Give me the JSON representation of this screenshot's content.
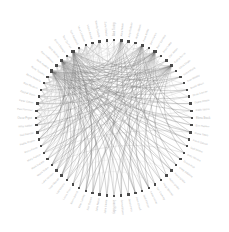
{
  "figure": {
    "background_color": "#ffffff",
    "width": 229,
    "height": 232
  },
  "chart_data": {
    "type": "network-chord",
    "title": "",
    "subtitle": "",
    "xlabel": "",
    "ylabel": "",
    "legend": [],
    "annotations": [],
    "layout": {
      "arrangement": "circular",
      "center_x": 114,
      "center_y": 118,
      "node_radius": 78,
      "label_radius": 82,
      "grid": false,
      "axes_visible": false,
      "label_orientation": "radial-outward",
      "start_angle_deg": -90,
      "direction": "clockwise"
    },
    "style": {
      "node_color": "#4a4a4a",
      "node_shape": "square",
      "node_size_px": 2.4,
      "hub_node_size_px": 3.2,
      "edge_color": "#9a9a9a",
      "edge_color_light": "#c8c8c8",
      "edge_color_dark": "#6e6e6e",
      "edge_width": 0.35,
      "label_color": "#b9b9b9",
      "label_font_size_px": 2.6
    },
    "node_count": 68,
    "nodes": [
      {
        "id": 0,
        "label": "Alan Turing"
      },
      {
        "id": 1,
        "label": "Alice Nolan"
      },
      {
        "id": 2,
        "label": "Amy Robson"
      },
      {
        "id": 3,
        "label": "Andre Marek"
      },
      {
        "id": 4,
        "label": "Anne Keller"
      },
      {
        "id": 5,
        "label": "Ben Harkin"
      },
      {
        "id": 6,
        "label": "Beth Conway"
      },
      {
        "id": 7,
        "label": "Brian Lowe"
      },
      {
        "id": 8,
        "label": "Carl Aston"
      },
      {
        "id": 9,
        "label": "Cathy Burns"
      },
      {
        "id": 10,
        "label": "Chris Doyle"
      },
      {
        "id": 11,
        "label": "Clara Mertz"
      },
      {
        "id": 12,
        "label": "Dan Whitby"
      },
      {
        "id": 13,
        "label": "David Olsen"
      },
      {
        "id": 14,
        "label": "Dean Farrow"
      },
      {
        "id": 15,
        "label": "Diana Reyes"
      },
      {
        "id": 16,
        "label": "Edith Vance"
      },
      {
        "id": 17,
        "label": "Elena Brask"
      },
      {
        "id": 18,
        "label": "Eric Halden"
      },
      {
        "id": 19,
        "label": "Fiona Yates"
      },
      {
        "id": 20,
        "label": "Frank Oduya"
      },
      {
        "id": 21,
        "label": "Gail Winter"
      },
      {
        "id": 22,
        "label": "Gary Nevins"
      },
      {
        "id": 23,
        "label": "Grace Holt"
      },
      {
        "id": 24,
        "label": "Greg Saldana"
      },
      {
        "id": 25,
        "label": "Hana Ishida"
      },
      {
        "id": 26,
        "label": "Helen Drake"
      },
      {
        "id": 27,
        "label": "Hugo Bennet"
      },
      {
        "id": 28,
        "label": "Ian Crawley"
      },
      {
        "id": 29,
        "label": "Irene Kovac"
      },
      {
        "id": 30,
        "label": "Jack Mercer"
      },
      {
        "id": 31,
        "label": "Jane Orwell"
      },
      {
        "id": 32,
        "label": "Jason Petri"
      },
      {
        "id": 33,
        "label": "Jenna Bloom"
      },
      {
        "id": 34,
        "label": "Joan Ridley"
      },
      {
        "id": 35,
        "label": "John Castle"
      },
      {
        "id": 36,
        "label": "Julia Nakai"
      },
      {
        "id": 37,
        "label": "Karl Ostrom"
      },
      {
        "id": 38,
        "label": "Kate Lumley"
      },
      {
        "id": 39,
        "label": "Kevin Brand"
      },
      {
        "id": 40,
        "label": "Laura Finch"
      },
      {
        "id": 41,
        "label": "Leo Vantini"
      },
      {
        "id": 42,
        "label": "Lisa Mowatt"
      },
      {
        "id": 43,
        "label": "Luke Hanson"
      },
      {
        "id": 44,
        "label": "Maria Solen"
      },
      {
        "id": 45,
        "label": "Mark Delane"
      },
      {
        "id": 46,
        "label": "Mary Ashton"
      },
      {
        "id": 47,
        "label": "Mona Ferris"
      },
      {
        "id": 48,
        "label": "Nadia Rostov"
      },
      {
        "id": 49,
        "label": "Neil Barrow"
      },
      {
        "id": 50,
        "label": "Nina Calder"
      },
      {
        "id": 51,
        "label": "Oscar Pryce"
      },
      {
        "id": 52,
        "label": "Paul Stenner"
      },
      {
        "id": 53,
        "label": "Peter Galvin"
      },
      {
        "id": 54,
        "label": "Rachel Dunn"
      },
      {
        "id": 55,
        "label": "Ray Bledsoe"
      },
      {
        "id": 56,
        "label": "Rhea Nakada"
      },
      {
        "id": 57,
        "label": "Rose Tanaka"
      },
      {
        "id": 58,
        "label": "Ruth Aveline"
      },
      {
        "id": 59,
        "label": "Sam Holloway"
      },
      {
        "id": 60,
        "label": "Sara Medina"
      },
      {
        "id": 61,
        "label": "Simon Ralegh"
      },
      {
        "id": 62,
        "label": "Tara Quinlan"
      },
      {
        "id": 63,
        "label": "Tom Beckford"
      },
      {
        "id": 64,
        "label": "Vera Lindqvist"
      },
      {
        "id": 65,
        "label": "Victor Amadi"
      },
      {
        "id": 66,
        "label": "Wendy Carlyle"
      },
      {
        "id": 67,
        "label": "Zane Okafor"
      }
    ],
    "hubs": [
      {
        "id": 58,
        "degree": 34
      },
      {
        "id": 60,
        "degree": 30
      },
      {
        "id": 62,
        "degree": 26
      },
      {
        "id": 6,
        "degree": 24
      },
      {
        "id": 9,
        "degree": 22
      },
      {
        "id": 4,
        "degree": 16
      },
      {
        "id": 1,
        "degree": 12
      }
    ],
    "edges": [
      [
        58,
        6
      ],
      [
        58,
        9
      ],
      [
        58,
        4
      ],
      [
        58,
        1
      ],
      [
        58,
        60
      ],
      [
        58,
        62
      ],
      [
        58,
        3
      ],
      [
        58,
        11
      ],
      [
        58,
        14
      ],
      [
        58,
        17
      ],
      [
        58,
        20
      ],
      [
        58,
        23
      ],
      [
        58,
        26
      ],
      [
        58,
        29
      ],
      [
        58,
        32
      ],
      [
        58,
        35
      ],
      [
        58,
        38
      ],
      [
        58,
        41
      ],
      [
        58,
        44
      ],
      [
        58,
        47
      ],
      [
        58,
        50
      ],
      [
        58,
        53
      ],
      [
        58,
        56
      ],
      [
        58,
        64
      ],
      [
        58,
        66
      ],
      [
        58,
        2
      ],
      [
        58,
        8
      ],
      [
        58,
        13
      ],
      [
        58,
        19
      ],
      [
        58,
        25
      ],
      [
        58,
        31
      ],
      [
        58,
        37
      ],
      [
        58,
        43
      ],
      [
        58,
        49
      ],
      [
        60,
        6
      ],
      [
        60,
        9
      ],
      [
        60,
        4
      ],
      [
        60,
        62
      ],
      [
        60,
        1
      ],
      [
        60,
        12
      ],
      [
        60,
        15
      ],
      [
        60,
        18
      ],
      [
        60,
        21
      ],
      [
        60,
        24
      ],
      [
        60,
        27
      ],
      [
        60,
        30
      ],
      [
        60,
        33
      ],
      [
        60,
        36
      ],
      [
        60,
        39
      ],
      [
        60,
        42
      ],
      [
        60,
        45
      ],
      [
        60,
        48
      ],
      [
        60,
        51
      ],
      [
        60,
        54
      ],
      [
        60,
        57
      ],
      [
        60,
        63
      ],
      [
        60,
        65
      ],
      [
        60,
        67
      ],
      [
        60,
        5
      ],
      [
        60,
        10
      ],
      [
        60,
        16
      ],
      [
        60,
        22
      ],
      [
        60,
        28
      ],
      [
        60,
        34
      ],
      [
        62,
        6
      ],
      [
        62,
        9
      ],
      [
        62,
        4
      ],
      [
        62,
        1
      ],
      [
        62,
        7
      ],
      [
        62,
        13
      ],
      [
        62,
        19
      ],
      [
        62,
        25
      ],
      [
        62,
        31
      ],
      [
        62,
        37
      ],
      [
        62,
        43
      ],
      [
        62,
        49
      ],
      [
        62,
        55
      ],
      [
        62,
        59
      ],
      [
        62,
        61
      ],
      [
        62,
        64
      ],
      [
        62,
        2
      ],
      [
        62,
        11
      ],
      [
        62,
        20
      ],
      [
        62,
        29
      ],
      [
        62,
        38
      ],
      [
        62,
        47
      ],
      [
        62,
        52
      ],
      [
        62,
        56
      ],
      [
        62,
        66
      ],
      [
        62,
        0
      ],
      [
        6,
        9
      ],
      [
        6,
        4
      ],
      [
        6,
        1
      ],
      [
        6,
        12
      ],
      [
        6,
        18
      ],
      [
        6,
        24
      ],
      [
        6,
        30
      ],
      [
        6,
        36
      ],
      [
        6,
        42
      ],
      [
        6,
        48
      ],
      [
        6,
        54
      ],
      [
        6,
        57
      ],
      [
        6,
        63
      ],
      [
        6,
        67
      ],
      [
        6,
        3
      ],
      [
        6,
        15
      ],
      [
        6,
        27
      ],
      [
        6,
        39
      ],
      [
        6,
        51
      ],
      [
        6,
        65
      ],
      [
        6,
        21
      ],
      [
        6,
        33
      ],
      [
        6,
        45
      ],
      [
        6,
        59
      ],
      [
        9,
        4
      ],
      [
        9,
        1
      ],
      [
        9,
        14
      ],
      [
        9,
        20
      ],
      [
        9,
        26
      ],
      [
        9,
        32
      ],
      [
        9,
        38
      ],
      [
        9,
        44
      ],
      [
        9,
        50
      ],
      [
        9,
        56
      ],
      [
        9,
        64
      ],
      [
        9,
        66
      ],
      [
        9,
        5
      ],
      [
        9,
        17
      ],
      [
        9,
        29
      ],
      [
        9,
        41
      ],
      [
        9,
        53
      ],
      [
        9,
        61
      ],
      [
        9,
        10
      ],
      [
        9,
        22
      ],
      [
        9,
        34
      ],
      [
        9,
        46
      ],
      [
        4,
        1
      ],
      [
        4,
        16
      ],
      [
        4,
        28
      ],
      [
        4,
        40
      ],
      [
        4,
        52
      ],
      [
        4,
        2
      ],
      [
        4,
        19
      ],
      [
        4,
        31
      ],
      [
        4,
        43
      ],
      [
        4,
        55
      ],
      [
        4,
        7
      ],
      [
        4,
        25
      ],
      [
        4,
        37
      ],
      [
        4,
        49
      ],
      [
        4,
        61
      ],
      [
        4,
        13
      ],
      [
        1,
        8
      ],
      [
        1,
        23
      ],
      [
        1,
        35
      ],
      [
        1,
        47
      ],
      [
        1,
        59
      ],
      [
        1,
        11
      ],
      [
        1,
        29
      ],
      [
        1,
        41
      ],
      [
        1,
        53
      ],
      [
        1,
        65
      ],
      [
        1,
        17
      ],
      [
        1,
        44
      ],
      [
        50,
        51
      ],
      [
        51,
        52
      ],
      [
        52,
        53
      ],
      [
        53,
        54
      ],
      [
        54,
        55
      ],
      [
        55,
        56
      ],
      [
        56,
        57
      ],
      [
        57,
        58
      ],
      [
        58,
        59
      ],
      [
        59,
        60
      ],
      [
        60,
        61
      ],
      [
        61,
        62
      ],
      [
        62,
        63
      ],
      [
        63,
        64
      ],
      [
        64,
        65
      ],
      [
        65,
        66
      ],
      [
        49,
        51
      ],
      [
        50,
        52
      ],
      [
        51,
        53
      ],
      [
        52,
        54
      ],
      [
        53,
        55
      ],
      [
        54,
        56
      ],
      [
        55,
        57
      ],
      [
        56,
        58
      ],
      [
        57,
        59
      ],
      [
        58,
        61
      ],
      [
        59,
        62
      ],
      [
        60,
        63
      ],
      [
        61,
        64
      ],
      [
        62,
        65
      ],
      [
        63,
        66
      ],
      [
        48,
        52
      ],
      [
        50,
        54
      ],
      [
        52,
        56
      ],
      [
        54,
        58
      ],
      [
        56,
        60
      ],
      [
        58,
        62
      ],
      [
        60,
        64
      ],
      [
        62,
        66
      ],
      [
        47,
        53
      ],
      [
        49,
        55
      ],
      [
        51,
        57
      ],
      [
        53,
        59
      ],
      [
        55,
        61
      ],
      [
        57,
        63
      ],
      [
        59,
        65
      ],
      [
        46,
        54
      ],
      [
        48,
        56
      ],
      [
        50,
        58
      ],
      [
        52,
        60
      ],
      [
        54,
        62
      ],
      [
        56,
        64
      ],
      [
        58,
        66
      ],
      [
        45,
        55
      ],
      [
        47,
        57
      ],
      [
        49,
        59
      ],
      [
        51,
        61
      ],
      [
        53,
        63
      ],
      [
        55,
        65
      ],
      [
        44,
        56
      ],
      [
        46,
        58
      ],
      [
        48,
        60
      ],
      [
        50,
        62
      ],
      [
        52,
        64
      ],
      [
        54,
        66
      ],
      [
        43,
        57
      ],
      [
        45,
        59
      ],
      [
        47,
        61
      ],
      [
        49,
        63
      ],
      [
        51,
        65
      ],
      [
        42,
        58
      ],
      [
        44,
        60
      ],
      [
        46,
        62
      ],
      [
        48,
        64
      ],
      [
        50,
        66
      ],
      [
        41,
        59
      ],
      [
        43,
        61
      ],
      [
        45,
        63
      ],
      [
        47,
        65
      ],
      [
        40,
        60
      ],
      [
        42,
        62
      ],
      [
        44,
        64
      ],
      [
        46,
        66
      ],
      [
        39,
        61
      ],
      [
        41,
        63
      ],
      [
        43,
        65
      ],
      [
        38,
        62
      ],
      [
        40,
        64
      ],
      [
        42,
        66
      ],
      [
        15,
        59
      ],
      [
        18,
        61
      ],
      [
        12,
        57
      ],
      [
        10,
        55
      ],
      [
        8,
        53
      ],
      [
        21,
        63
      ],
      [
        24,
        65
      ],
      [
        27,
        67
      ],
      [
        30,
        0
      ],
      [
        33,
        2
      ],
      [
        16,
        48
      ],
      [
        19,
        46
      ],
      [
        22,
        44
      ],
      [
        25,
        42
      ],
      [
        28,
        40
      ],
      [
        13,
        50
      ],
      [
        11,
        52
      ],
      [
        14,
        54
      ],
      [
        17,
        56
      ],
      [
        5,
        35
      ],
      [
        7,
        33
      ],
      [
        3,
        37
      ],
      [
        0,
        39
      ],
      [
        31,
        64
      ],
      [
        34,
        66
      ],
      [
        36,
        67
      ],
      [
        2,
        45
      ],
      [
        5,
        47
      ],
      [
        8,
        49
      ]
    ]
  }
}
